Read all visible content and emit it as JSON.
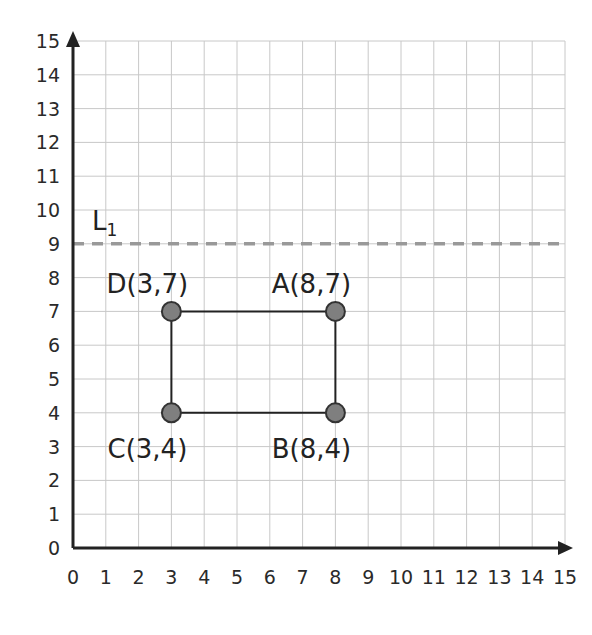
{
  "chart_data": {
    "type": "scatter",
    "title": "",
    "xlabel": "",
    "ylabel": "",
    "xlim": [
      0,
      15
    ],
    "ylim": [
      0,
      15
    ],
    "grid": true,
    "x_ticks": [
      "0",
      "1",
      "2",
      "3",
      "4",
      "5",
      "6",
      "7",
      "8",
      "9",
      "10",
      "11",
      "12",
      "13",
      "14",
      "15"
    ],
    "y_ticks": [
      "0",
      "1",
      "2",
      "3",
      "4",
      "5",
      "6",
      "7",
      "8",
      "9",
      "10",
      "11",
      "12",
      "13",
      "14",
      "15"
    ],
    "points": [
      {
        "name": "A",
        "x": 8,
        "y": 7,
        "label": "A(8,7)"
      },
      {
        "name": "B",
        "x": 8,
        "y": 4,
        "label": "B(8,4)"
      },
      {
        "name": "C",
        "x": 3,
        "y": 4,
        "label": "C(3,4)"
      },
      {
        "name": "D",
        "x": 3,
        "y": 7,
        "label": "D(3,7)"
      }
    ],
    "polygon": [
      "D",
      "A",
      "B",
      "C"
    ],
    "lines": [
      {
        "name": "L1",
        "label_main": "L",
        "label_sub": "1",
        "type": "horizontal",
        "y": 9,
        "style": "dashed",
        "color": "#999999"
      }
    ]
  },
  "colors": {
    "axis": "#222222",
    "grid": "#c8c8c8",
    "point_fill": "#7f7f7f",
    "point_stroke": "#333333",
    "dashed_line": "#9a9a9a"
  }
}
